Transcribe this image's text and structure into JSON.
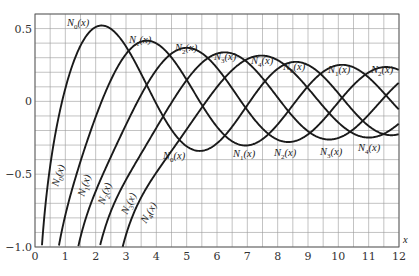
{
  "chart_data": {
    "type": "line",
    "title": "",
    "xlabel": "x",
    "ylabel": "",
    "xlim": [
      0,
      12
    ],
    "ylim": [
      -1.0,
      0.6
    ],
    "grid": true,
    "grid_x_step": 0.5,
    "grid_y_step": 0.1,
    "x_ticks": [
      "0",
      "1",
      "2",
      "3",
      "4",
      "5",
      "6",
      "7",
      "8",
      "9",
      "10",
      "11",
      "12"
    ],
    "y_ticks": [
      "0.5",
      "0",
      "−0.5",
      "−1.0"
    ],
    "y_tick_values": [
      0.5,
      0,
      -0.5,
      -1.0
    ],
    "legend": "none (curves labeled inline)",
    "x": [
      1,
      2,
      3,
      4,
      5,
      6,
      7,
      8,
      9,
      10,
      11,
      12
    ],
    "series": [
      {
        "name": "N0(x)",
        "order": 0,
        "values": [
          0.0883,
          0.5104,
          0.3769,
          -0.0169,
          -0.3085,
          -0.2882,
          -0.0259,
          0.2235,
          0.2499,
          0.0557,
          -0.1688,
          -0.2252
        ]
      },
      {
        "name": "N1(x)",
        "order": 1,
        "values": [
          -0.7812,
          -0.107,
          0.3247,
          0.3979,
          0.1479,
          -0.175,
          -0.3027,
          -0.1581,
          0.1043,
          0.249,
          0.1637,
          -0.0571
        ]
      },
      {
        "name": "N2(x)",
        "order": 2,
        "values": [
          -1.6507,
          -0.6174,
          -0.1604,
          0.2159,
          0.3677,
          0.2299,
          -0.0605,
          -0.263,
          -0.2268,
          -0.0059,
          0.1991,
          0.2157
        ]
      },
      {
        "name": "N3(x)",
        "order": 3,
        "values": [
          -5.8215,
          -1.1278,
          -0.5385,
          -0.1821,
          0.1463,
          0.3282,
          0.2708,
          0.0265,
          -0.2073,
          -0.2513,
          -0.0722,
          0.15
        ]
      },
      {
        "name": "N4(x)",
        "order": 4,
        "values": [
          -33.2784,
          -2.7659,
          -1.0282,
          -0.4996,
          -0.1918,
          0.0983,
          0.3039,
          0.2725,
          0.0467,
          -0.1921,
          -0.2454,
          -0.0935
        ]
      }
    ],
    "annotations": [
      {
        "text": "N0(x)",
        "position": "first maximum",
        "x": 1.9,
        "y": 0.52
      },
      {
        "text": "N1(x)",
        "position": "first maximum",
        "x": 3.6,
        "y": 0.43
      },
      {
        "text": "N2(x)",
        "position": "first maximum",
        "x": 4.9,
        "y": 0.38
      },
      {
        "text": "N3(x)",
        "position": "first maximum",
        "x": 6.0,
        "y": 0.35
      },
      {
        "text": "N4(x)",
        "position": "first maximum",
        "x": 7.3,
        "y": 0.32
      },
      {
        "text": "N0(x)",
        "position": "second maximum",
        "x": 8.5,
        "y": 0.29
      },
      {
        "text": "N1(x)",
        "position": "second maximum",
        "x": 9.9,
        "y": 0.27
      },
      {
        "text": "N2(x)",
        "position": "second maximum",
        "x": 11.3,
        "y": 0.27
      },
      {
        "text": "N0(x)",
        "position": "first minimum",
        "x": 5.5,
        "y": -0.35
      },
      {
        "text": "N1(x)",
        "position": "first minimum",
        "x": 7.1,
        "y": -0.33
      },
      {
        "text": "N2(x)",
        "position": "first minimum",
        "x": 8.5,
        "y": -0.32
      },
      {
        "text": "N3(x)",
        "position": "first minimum",
        "x": 10.0,
        "y": -0.31
      },
      {
        "text": "N4(x)",
        "position": "first minimum",
        "x": 11.3,
        "y": -0.29
      },
      {
        "text": "N0(x)",
        "position": "rising branch (rotated)",
        "x": 0.65,
        "y": -0.45
      },
      {
        "text": "N1(x)",
        "position": "rising branch (rotated)",
        "x": 1.55,
        "y": -0.5
      },
      {
        "text": "N2(x)",
        "position": "rising branch (rotated)",
        "x": 2.25,
        "y": -0.55
      },
      {
        "text": "N3(x)",
        "position": "rising branch (rotated)",
        "x": 3.0,
        "y": -0.6
      },
      {
        "text": "N4(x)",
        "position": "rising branch (rotated)",
        "x": 3.6,
        "y": -0.65
      }
    ]
  },
  "labels": {
    "x_axis_var": "x",
    "func_prefix": "N",
    "func_suffix": "(x)"
  }
}
